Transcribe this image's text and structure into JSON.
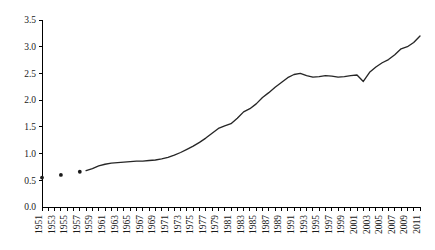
{
  "chart_data": {
    "type": "line",
    "title": "",
    "subtitle": "",
    "xlabel": "",
    "ylabel": "",
    "xlim": [
      1951,
      2011
    ],
    "ylim": [
      0.0,
      3.5
    ],
    "grid": false,
    "legend": null,
    "y_ticks": [
      "0.0",
      "0.5",
      "1.0",
      "1.5",
      "2.0",
      "2.5",
      "3.0",
      "3.5"
    ],
    "y_tick_values": [
      0.0,
      0.5,
      1.0,
      1.5,
      2.0,
      2.5,
      3.0,
      3.5
    ],
    "x_tick_labels": [
      "1951",
      "1953",
      "1955",
      "1957",
      "1959",
      "1961",
      "1963",
      "1965",
      "1967",
      "1969",
      "1971",
      "1973",
      "1975",
      "1977",
      "1979",
      "1981",
      "1983",
      "1985",
      "1987",
      "1989",
      "1991",
      "1993",
      "1995",
      "1997",
      "1999",
      "2001",
      "2003",
      "2005",
      "2007",
      "2009",
      "2011"
    ],
    "x_tick_values": [
      1951,
      1953,
      1955,
      1957,
      1959,
      1961,
      1963,
      1965,
      1967,
      1969,
      1971,
      1973,
      1975,
      1977,
      1979,
      1981,
      1983,
      1985,
      1987,
      1989,
      1991,
      1993,
      1995,
      1997,
      1999,
      2001,
      2003,
      2005,
      2007,
      2009,
      2011
    ],
    "x_minor_tick_step": 1,
    "series": [
      {
        "name": "scatter-points",
        "marker": "dot",
        "style": "points",
        "x": [
          1951,
          1954,
          1957
        ],
        "values": [
          0.55,
          0.6,
          0.66
        ]
      },
      {
        "name": "main-line",
        "style": "line",
        "x": [
          1958,
          1959,
          1960,
          1961,
          1962,
          1963,
          1964,
          1965,
          1966,
          1967,
          1968,
          1969,
          1970,
          1971,
          1972,
          1973,
          1974,
          1975,
          1976,
          1977,
          1978,
          1979,
          1980,
          1981,
          1982,
          1983,
          1984,
          1985,
          1986,
          1987,
          1988,
          1989,
          1990,
          1991,
          1992,
          1993,
          1994,
          1995,
          1996,
          1997,
          1998,
          1999,
          2000,
          2001,
          2002,
          2003,
          2004,
          2005,
          2006,
          2007,
          2008,
          2009,
          2010,
          2011
        ],
        "values": [
          0.68,
          0.72,
          0.77,
          0.8,
          0.82,
          0.83,
          0.84,
          0.85,
          0.86,
          0.86,
          0.87,
          0.88,
          0.9,
          0.93,
          0.97,
          1.02,
          1.08,
          1.14,
          1.21,
          1.29,
          1.38,
          1.47,
          1.52,
          1.56,
          1.66,
          1.78,
          1.84,
          1.93,
          2.05,
          2.14,
          2.24,
          2.33,
          2.42,
          2.48,
          2.5,
          2.46,
          2.43,
          2.44,
          2.46,
          2.45,
          2.43,
          2.44,
          2.46,
          2.47,
          2.35,
          2.52,
          2.62,
          2.7,
          2.76,
          2.85,
          2.96,
          3.0,
          3.08,
          3.2
        ]
      }
    ]
  }
}
